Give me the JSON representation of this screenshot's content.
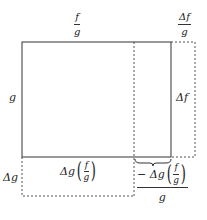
{
  "diagram": {
    "colors": {
      "line": "#333333",
      "background": "#ffffff"
    },
    "labels": {
      "top_width": {
        "numerator": "f",
        "denominator": "g"
      },
      "top_delta_width": {
        "numerator": "Δf",
        "denominator": "g"
      },
      "left_height": "g",
      "right_delta_height": "Δf",
      "left_delta_height": "Δg",
      "bottom_area": {
        "prefix": "Δg",
        "numerator": "f",
        "denominator": "g"
      },
      "bottom_right": {
        "prefix": "− Δg",
        "numerator": "f",
        "denominator": "g",
        "outer_denominator": "g"
      }
    },
    "shapes": {
      "solid_rect": {
        "x1": 22,
        "y1": 42,
        "x2": 171,
        "y2": 157
      },
      "dashed_inner_vertical_x": 134,
      "dashed_outer_right_x": 195,
      "dashed_bottom_y": 196
    }
  }
}
